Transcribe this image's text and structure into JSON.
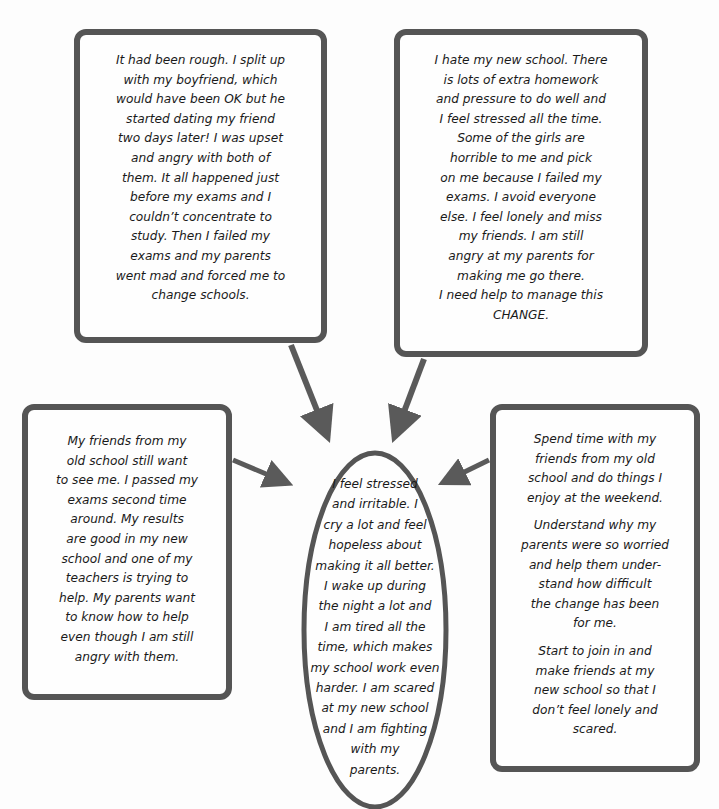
{
  "diagram": {
    "type": "concept-map",
    "center": {
      "shape": "ellipse",
      "lines": [
        "I feel stressed",
        "and irritable. I",
        "cry a lot and feel",
        "hopeless about",
        "making it all better.",
        "I wake up during",
        "the night a lot and",
        "I am tired all the",
        "time, which makes",
        "my school work even",
        "harder. I am scared",
        "at my new school",
        "and I am fighting",
        "with my",
        "parents."
      ]
    },
    "top_left": {
      "lines": [
        "It had been rough. I split up",
        "with my boyfriend, which",
        "would have been OK but he",
        "started dating my friend",
        "two days later! I was upset",
        "and angry with both of",
        "them. It all happened just",
        "before my exams and I",
        "couldn’t concentrate to",
        "study. Then I failed my",
        "exams and my parents",
        "went mad and forced me to",
        "change schools."
      ]
    },
    "top_right": {
      "lines": [
        "I hate my new school. There",
        "is lots of extra homework",
        "and pressure to do well and",
        "I feel stressed all the time.",
        "Some of the girls are",
        "horrible to me and pick",
        "on me because I failed my",
        "exams. I avoid everyone",
        "else. I feel lonely and miss",
        "my friends. I am still",
        "angry at my parents for",
        "making me go there.",
        "I need help to manage this",
        "CHANGE."
      ]
    },
    "left": {
      "lines": [
        "My friends from my",
        "old school still want",
        "to see me. I passed my",
        "exams second time",
        "around. My results",
        "are good in my new",
        "school and one of my",
        "teachers is trying to",
        "help. My parents want",
        "to know how to help",
        "even though I am still",
        "angry with them."
      ]
    },
    "right": {
      "paragraphs": [
        [
          "Spend time with my",
          "friends from my old",
          "school and do things I",
          "enjoy at the weekend."
        ],
        [
          "Understand why my",
          "parents were so worried",
          "and help them under-",
          "stand how difficult",
          "the change has been",
          "for me."
        ],
        [
          "Start to join in and",
          "make friends at my",
          "new school so that I",
          "don’t feel lonely and",
          "scared."
        ]
      ]
    },
    "colors": {
      "border": "#555555",
      "arrow": "#5a5a5a",
      "text": "#1a1a1a",
      "background": "#fdfdfd"
    }
  }
}
